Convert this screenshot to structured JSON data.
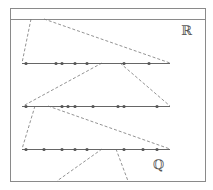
{
  "diagram": {
    "labels": {
      "reals": "ℝ",
      "rationals": "ℚ"
    },
    "colors": {
      "frame": "#8a8a8a",
      "line": "#666666",
      "dot": "#555555",
      "dash": "#777777"
    },
    "frame": {
      "x1": 10,
      "y1": 8,
      "x2": 205,
      "y2": 181,
      "header_y": 19
    },
    "number_lines": [
      {
        "y": 63,
        "x_start": 22,
        "x_end": 170,
        "dots": [
          26,
          56,
          62,
          75,
          87,
          124,
          149
        ]
      },
      {
        "y": 106,
        "x_start": 22,
        "x_end": 170,
        "dots": [
          26,
          62,
          68,
          75,
          93,
          118,
          124,
          157
        ]
      },
      {
        "y": 149,
        "x_start": 22,
        "x_end": 170,
        "dots": [
          26,
          44,
          62,
          75,
          87,
          124,
          143,
          157
        ]
      }
    ],
    "dashed_connectors": [
      {
        "x1": 31,
        "y1": 19,
        "x2": 22,
        "y2": 63
      },
      {
        "x1": 44,
        "y1": 19,
        "x2": 170,
        "y2": 63
      },
      {
        "x1": 102,
        "y1": 63,
        "x2": 23,
        "y2": 106
      },
      {
        "x1": 120,
        "y1": 63,
        "x2": 170,
        "y2": 106
      },
      {
        "x1": 35,
        "y1": 106,
        "x2": 22,
        "y2": 149
      },
      {
        "x1": 48,
        "y1": 106,
        "x2": 170,
        "y2": 149
      },
      {
        "x1": 102,
        "y1": 149,
        "x2": 57,
        "y2": 181
      },
      {
        "x1": 116,
        "y1": 149,
        "x2": 128,
        "y2": 181
      }
    ]
  }
}
